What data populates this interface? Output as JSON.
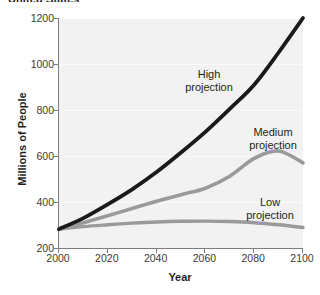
{
  "title": "United States",
  "axes": {
    "x_title": "Year",
    "y_title": "Millions of People",
    "x_ticks": [
      "2000",
      "2020",
      "2040",
      "2060",
      "2080",
      "2100"
    ],
    "y_ticks": [
      "1200",
      "1000",
      "800",
      "600",
      "400",
      "200"
    ]
  },
  "annotations": {
    "high": {
      "line1": "High",
      "line2": "projection"
    },
    "medium": {
      "line1": "Medium",
      "line2": "projection"
    },
    "low": {
      "line1": "Low",
      "line2": "projection"
    }
  },
  "colors": {
    "high_curve": "#1a1a1a",
    "medium_curve": "#9a9a9a",
    "low_curve": "#9a9a9a",
    "plot_background": "#f2f2f2",
    "gridline": "#fbfbfb",
    "axis": "#7d7d7d",
    "text": "#231f20"
  },
  "chart_data": {
    "type": "line",
    "title": "United States",
    "xlabel": "Year",
    "ylabel": "Millions of People",
    "xlim": [
      2000,
      2100
    ],
    "ylim": [
      200,
      1200
    ],
    "x_tick_values": [
      2000,
      2020,
      2040,
      2060,
      2080,
      2100
    ],
    "y_tick_values": [
      200,
      400,
      600,
      800,
      1000,
      1200
    ],
    "grid": true,
    "legend": "inline-annotations",
    "x": [
      2000,
      2010,
      2020,
      2030,
      2040,
      2050,
      2060,
      2070,
      2080,
      2090,
      2100
    ],
    "series": [
      {
        "name": "High projection",
        "color": "#1a1a1a",
        "values": [
          282,
          330,
          390,
          455,
          530,
          615,
          705,
          805,
          910,
          1050,
          1200
        ]
      },
      {
        "name": "Medium projection",
        "color": "#9a9a9a",
        "values": [
          282,
          310,
          340,
          372,
          403,
          432,
          460,
          512,
          590,
          622,
          570
        ]
      },
      {
        "name": "Low projection",
        "color": "#9a9a9a",
        "values": [
          282,
          293,
          301,
          308,
          313,
          316,
          317,
          315,
          310,
          301,
          289
        ]
      }
    ]
  }
}
